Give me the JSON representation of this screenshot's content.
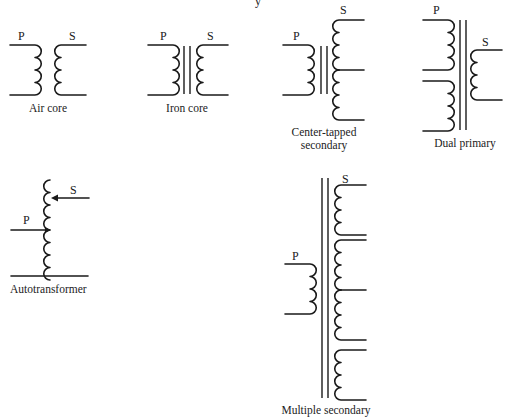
{
  "diagram": {
    "title_fragment": "y",
    "line_color": "#1a1a1a",
    "background": "#ffffff",
    "labels": {
      "primary": "P",
      "secondary": "S"
    },
    "transformers": [
      {
        "id": "air-core",
        "caption": [
          "Air core"
        ],
        "core": "none"
      },
      {
        "id": "iron-core",
        "caption": [
          "Iron core"
        ],
        "core": "iron"
      },
      {
        "id": "center-tapped-secondary",
        "caption": [
          "Center-tapped",
          "secondary"
        ],
        "core": "iron"
      },
      {
        "id": "dual-primary",
        "caption": [
          "Dual primary"
        ],
        "core": "iron"
      },
      {
        "id": "autotransformer",
        "caption": [
          "Autotransformer"
        ],
        "core": "none"
      },
      {
        "id": "multiple-secondary",
        "caption": [
          "Multiple secondary"
        ],
        "core": "iron"
      }
    ]
  }
}
